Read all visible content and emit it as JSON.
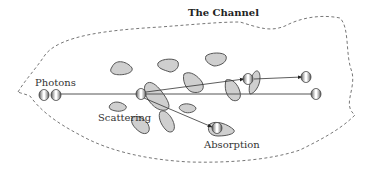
{
  "diagram": {
    "title": "The Channel",
    "labels": {
      "photons": "Photons",
      "scattering": "Scattering",
      "absorption": "Absorption"
    },
    "colors": {
      "blob_fill": "#cfcfcf",
      "blob_stroke": "#555555",
      "boundary": "#777777",
      "line": "#555555",
      "text": "#333333"
    },
    "nodes": [
      {
        "id": "photon-in-1",
        "role": "incoming photon"
      },
      {
        "id": "photon-in-2",
        "role": "incoming photon"
      },
      {
        "id": "scatter-event",
        "role": "scattering event"
      },
      {
        "id": "scattered-photon",
        "role": "scattered photon"
      },
      {
        "id": "scattered-out",
        "role": "scattered photon exiting"
      },
      {
        "id": "transmitted-photon",
        "role": "transmitted photon exiting"
      },
      {
        "id": "absorbed-photon",
        "role": "absorbed photon"
      }
    ],
    "edges": [
      {
        "from": "photons",
        "to": "transmitted-photon",
        "type": "straight path"
      },
      {
        "from": "scatter-event",
        "to": "scattered-photon",
        "type": "scattered path"
      },
      {
        "from": "scattered-photon",
        "to": "scattered-out",
        "type": "scattered path"
      },
      {
        "from": "scatter-event",
        "to": "absorbed-photon",
        "type": "absorption path"
      }
    ]
  }
}
